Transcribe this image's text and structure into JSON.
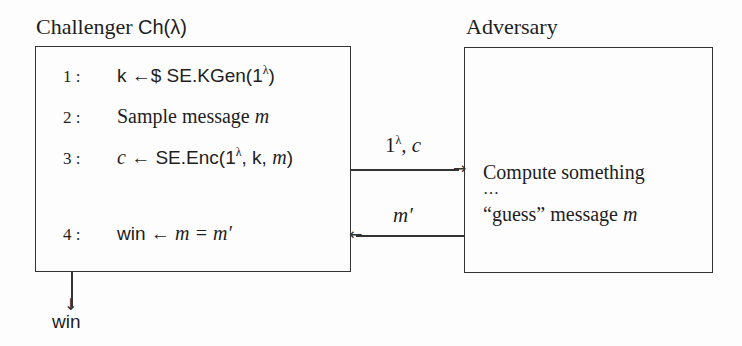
{
  "challenger": {
    "title": "Challenger",
    "title_fn": "Ch(λ)",
    "steps": [
      {
        "num": "1 :",
        "text_a": "k ←$ SE.KGen(1",
        "sup": "λ",
        "text_b": ")"
      },
      {
        "num": "2 :",
        "text_a": "Sample message ",
        "var": "m"
      },
      {
        "num": "3 :",
        "var_c": "c",
        "text_a": " ← SE.Enc(1",
        "sup": "λ",
        "text_b": ", k, ",
        "var": "m",
        "text_c": ")"
      },
      {
        "num": "4 :",
        "text_a": "win ← ",
        "var": "m = m′"
      }
    ],
    "output": "win"
  },
  "adversary": {
    "title": "Adversary",
    "lines": [
      "Compute something",
      "…",
      "“guess” message "
    ],
    "guess_var": "m"
  },
  "messages": {
    "to_adversary": {
      "base": "1",
      "sup": "λ",
      "rest": ", c"
    },
    "to_challenger": "m′"
  }
}
